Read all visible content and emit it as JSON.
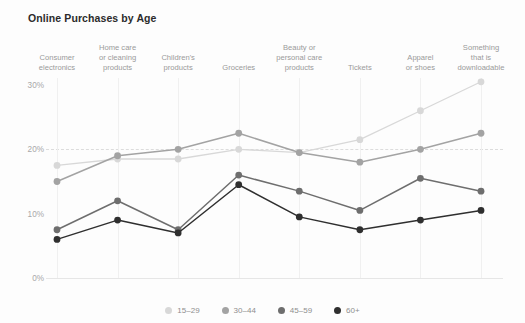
{
  "chart_data": {
    "type": "line",
    "title": "Online Purchases by Age",
    "xlabel": "",
    "ylabel": "",
    "ylim": [
      0,
      33
    ],
    "yticks": [
      0,
      10,
      20,
      30
    ],
    "ytick_labels": [
      "0%",
      "10%",
      "20%",
      "30%"
    ],
    "grid": true,
    "legend_position": "bottom",
    "categories": [
      "Consumer\nelectronics",
      "Home care\nor cleaning\nproducts",
      "Children's\nproducts",
      "Groceries",
      "Beauty or\npersonal care\nproducts",
      "Tickets",
      "Apparel\nor shoes",
      "Something\nthat is\ndownloadable"
    ],
    "series": [
      {
        "name": "15–29",
        "color": "#d8d8d8",
        "values": [
          17.5,
          18.5,
          18.5,
          20.0,
          19.5,
          21.5,
          26.0,
          30.5
        ]
      },
      {
        "name": "30–44",
        "color": "#a3a3a3",
        "values": [
          15.0,
          19.0,
          20.0,
          22.5,
          19.5,
          18.0,
          20.0,
          22.5
        ]
      },
      {
        "name": "45–59",
        "color": "#6e6e6e",
        "values": [
          7.5,
          12.0,
          7.5,
          16.0,
          13.5,
          10.5,
          15.5,
          13.5
        ]
      },
      {
        "name": "60+",
        "color": "#2f2f2f",
        "values": [
          6.0,
          9.0,
          7.0,
          14.5,
          9.5,
          7.5,
          9.0,
          10.5
        ]
      }
    ]
  },
  "legend": {
    "items": [
      {
        "label": "15–29",
        "color": "#d8d8d8"
      },
      {
        "label": "30–44",
        "color": "#a3a3a3"
      },
      {
        "label": "45–59",
        "color": "#6e6e6e"
      },
      {
        "label": "60+",
        "color": "#2f2f2f"
      }
    ]
  },
  "theme": {
    "background": "#fdfdfd",
    "title_color": "#2b2b2b",
    "label_color": "#9a9a9a",
    "grid_color": "#dcdcdc"
  }
}
